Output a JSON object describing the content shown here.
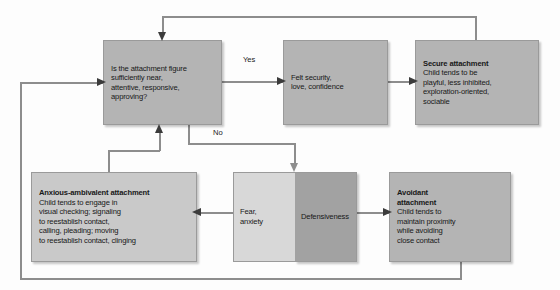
{
  "figure": {
    "type": "flowchart"
  },
  "nodes": {
    "question": {
      "body": "Is the attachment figure sufficiently near, attentive, responsive, approving?",
      "lines": [
        "Is the attachment figure",
        "sufficiently near,",
        "attentive, responsive,",
        "approving?"
      ],
      "tone": "#b4b4b4"
    },
    "felt_security": {
      "lines": [
        "Felt security,",
        "love, confidence"
      ],
      "tone": "#b4b4b4"
    },
    "secure": {
      "title": "Secure attachment",
      "lines": [
        "Child tends to be",
        "playful, less inhibited,",
        "exploration-oriented,",
        "sociable"
      ],
      "tone": "#b4b4b4"
    },
    "anxious": {
      "title": "Anxious-ambivalent attachment",
      "lines": [
        "Child tends to engage in",
        "visual checking; signaling",
        "to reestablish contact,",
        "calling, pleading; moving",
        "to reestablish contact, clinging"
      ],
      "tone": "#c9c9c9"
    },
    "fear": {
      "lines": [
        "Fear,",
        "anxiety"
      ],
      "tone": "#d8d8d8"
    },
    "defensiveness": {
      "lines": [
        "Defensiveness"
      ],
      "tone": "#a2a2a2"
    },
    "avoidant": {
      "title_lines": [
        "Avoidant",
        "attachment"
      ],
      "lines": [
        "Child tends to",
        "maintain proximity",
        "while avoiding",
        "close contact"
      ],
      "tone": "#b4b4b4"
    }
  },
  "edge_labels": {
    "yes": "Yes",
    "no": "No"
  },
  "colors": {
    "line": "#8d8d8d",
    "arrow": "#3b3b3b",
    "text": "#181818",
    "background": "#fdfdfd"
  }
}
